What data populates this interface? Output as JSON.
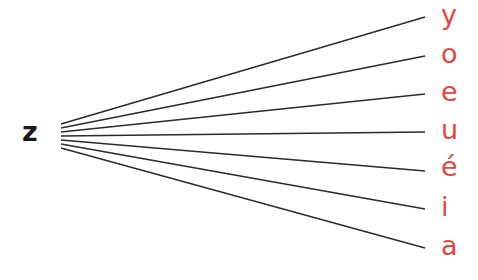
{
  "diagram": {
    "source": {
      "label": "z",
      "color": "#1a1a1a"
    },
    "targets": [
      {
        "label": "y",
        "y": 17
      },
      {
        "label": "o",
        "y": 56
      },
      {
        "label": "e",
        "y": 94
      },
      {
        "label": "u",
        "y": 132
      },
      {
        "label": "é",
        "y": 171
      },
      {
        "label": "i",
        "y": 209
      },
      {
        "label": "a",
        "y": 248
      }
    ],
    "target_color": "#e8463d",
    "line_color": "#2a2a2a"
  }
}
